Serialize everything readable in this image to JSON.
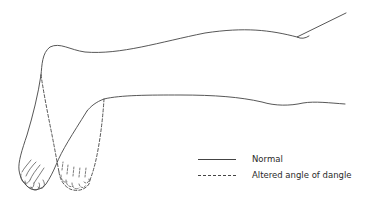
{
  "figure": {
    "line_color": "#444444",
    "background": "#ffffff"
  },
  "legend": {
    "items": [
      {
        "label": "Normal",
        "style": "solid"
      },
      {
        "label": "Altered angle of dangle",
        "style": "dashed"
      }
    ]
  }
}
